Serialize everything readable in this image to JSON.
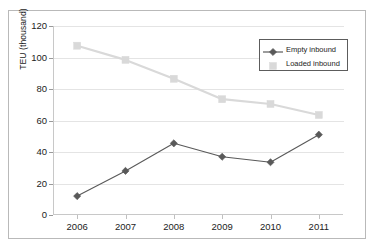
{
  "chart_data": {
    "type": "line",
    "title": "",
    "xlabel": "",
    "ylabel": "TEU (thousand)",
    "categories": [
      "2006",
      "2007",
      "2008",
      "2009",
      "2010",
      "2011"
    ],
    "series": [
      {
        "name": "Empty inbound",
        "color": "#595959",
        "marker": "diamond",
        "values": [
          12,
          28,
          45.5,
          37,
          33.5,
          51
        ]
      },
      {
        "name": "Loaded inbound",
        "color": "#d9d9d9",
        "marker": "square",
        "values": [
          107.5,
          98.5,
          86.5,
          73.5,
          70.5,
          63.5
        ]
      }
    ],
    "ylim": [
      0,
      120
    ],
    "yticks": [
      "0",
      "20",
      "40",
      "60",
      "80",
      "100",
      "120"
    ],
    "ytick_values": [
      0,
      20,
      40,
      60,
      80,
      100,
      120
    ],
    "grid": true,
    "legend_position": "top-right"
  },
  "legend": {
    "entries": [
      {
        "label": "Empty inbound"
      },
      {
        "label": "Loaded inbound"
      }
    ]
  },
  "colors": {
    "empty_inbound": "#595959",
    "loaded_inbound": "#d9d9d9",
    "gridline": "#e4e4e4",
    "axis": "#c8c8c8",
    "text": "#1c1c1c",
    "frame": "#b9b9b9",
    "legend_border": "#5c5c5c",
    "background": "#ffffff"
  }
}
